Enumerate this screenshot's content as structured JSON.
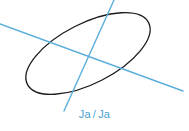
{
  "figure": {
    "background_color": "#ffffff",
    "width": 189,
    "height": 131,
    "ellipse": {
      "name": "ellipse-outline",
      "stroke_color": "#1a1a1a",
      "stroke_width": 1.3,
      "fill": "none",
      "center_x": 88,
      "center_y": 53.5,
      "radius_x": 68,
      "radius_y": 30,
      "rotation_deg": -27
    },
    "axis_lines": [
      {
        "name": "major-axis-line",
        "label": "major axis",
        "color": "#5aaedb",
        "stroke_width": 1.4,
        "x1": 0,
        "y1": 24,
        "x2": 183,
        "y2": 91
      },
      {
        "name": "minor-axis-line",
        "label": "minor axis",
        "color": "#5aaedb",
        "stroke_width": 1.4,
        "x1": 114,
        "y1": 0,
        "x2": 64,
        "y2": 111
      }
    ],
    "caption": {
      "text": "Ja / Ja",
      "left_word": "Ja",
      "separator": "/",
      "right_word": "Ja",
      "color": "#4a9fd4",
      "font_size_px": 11
    }
  }
}
